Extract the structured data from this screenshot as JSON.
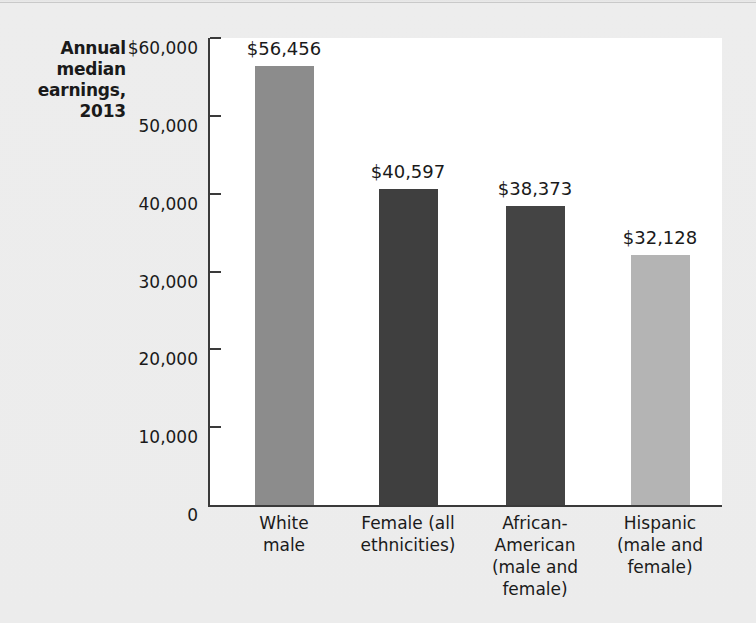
{
  "chart_data": {
    "type": "bar",
    "title_lines": [
      "Annual",
      "median",
      "earnings,",
      "2013"
    ],
    "xlabel": "",
    "ylabel": "Annual median earnings, 2013",
    "ylim": [
      0,
      60000
    ],
    "grid": false,
    "legend": "none",
    "ytick_labels": [
      "$60,000",
      "50,000",
      "40,000",
      "30,000",
      "20,000",
      "10,000",
      "0"
    ],
    "ytick_values": [
      60000,
      50000,
      40000,
      30000,
      20000,
      10000,
      0
    ],
    "categories": [
      "White male",
      "Female (all ethnicities)",
      "African-American (male and female)",
      "Hispanic (male and female)"
    ],
    "category_lines": [
      [
        "White",
        "male"
      ],
      [
        "Female (all",
        "ethnicities)"
      ],
      [
        "African-",
        "American",
        "(male and",
        "female)"
      ],
      [
        "Hispanic",
        "(male and",
        "female)"
      ]
    ],
    "values": [
      56456,
      40597,
      38373,
      32128
    ],
    "value_labels": [
      "$56,456",
      "$40,597",
      "$38,373",
      "$32,128"
    ],
    "bar_colors": [
      "#8c8c8c",
      "#3f3f3f",
      "#444444",
      "#b4b4b4"
    ]
  },
  "colors": {
    "page_background": "#ebebeb",
    "plot_background": "#ffffff",
    "axis": "#3a3a3a",
    "text": "#1a1a1a"
  }
}
